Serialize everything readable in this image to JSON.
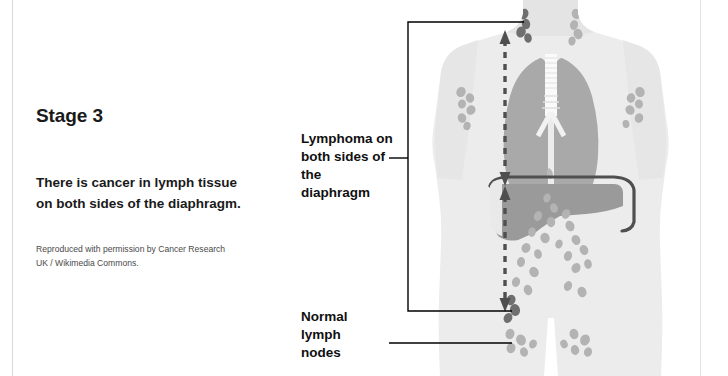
{
  "slide": {
    "title": "Stage 3",
    "description": "There is cancer in lymph tissue on both sides of the diaphragm.",
    "credit": "Reproduced with permission by Cancer Research UK / Wikimedia Commons."
  },
  "callouts": {
    "lymphoma": "Lymphoma on both sides of the diaphragm",
    "normal_nodes": "Normal lymph nodes"
  },
  "figure": {
    "alt": "Front view of a human torso showing lungs, trachea, diaphragm, liver and lymph nodes above and below the diaphragm",
    "anatomy": [
      "body-silhouette",
      "left-lung",
      "right-lung",
      "trachea",
      "diaphragm",
      "liver",
      "neck-lymph-nodes",
      "armpit-lymph-nodes",
      "abdominal-lymph-nodes",
      "groin-lymph-nodes"
    ],
    "arrows": [
      {
        "name": "above-diaphragm-extent-arrow",
        "style": "dashed-double-headed"
      },
      {
        "name": "below-diaphragm-extent-arrow",
        "style": "dashed-double-headed"
      }
    ]
  },
  "colors": {
    "body": "#ececec",
    "organ_gray": "#a9a9a9",
    "liver": "#9a9a9a",
    "diaphragm_outline": "#4f4f4f",
    "lymphoma_node": "#6f6f6f",
    "normal_node": "#b3b3b3",
    "arrow": "#4f4f4f",
    "leader_line": "#000000",
    "text": "#101010",
    "background": "#ffffff"
  }
}
